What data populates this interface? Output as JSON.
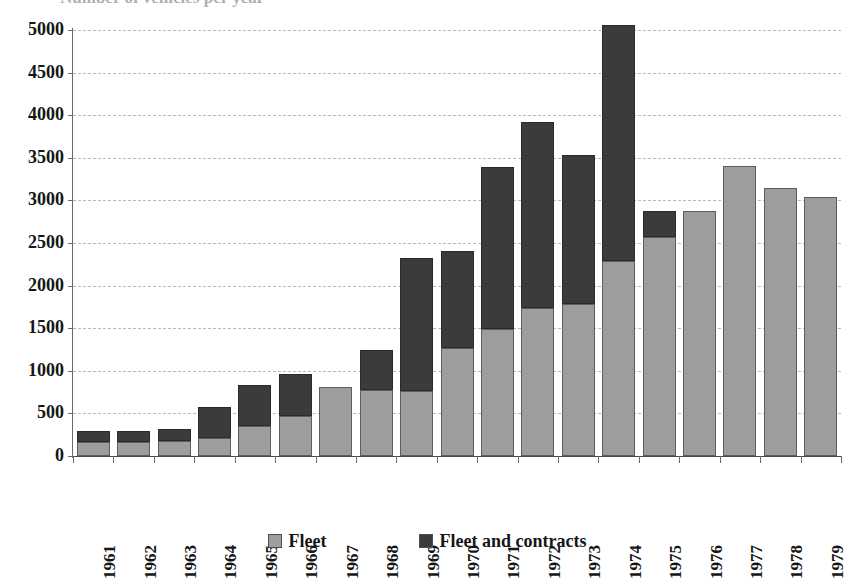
{
  "title_partial": "Number of vehicles per year",
  "legend": {
    "position": "bottom",
    "items": [
      {
        "label": "Fleet",
        "color": "#9d9d9d",
        "icon": "square-swatch-icon"
      },
      {
        "label": "Fleet and contracts",
        "color": "#3b3b3b",
        "icon": "square-swatch-icon"
      }
    ]
  },
  "chart_data": {
    "type": "bar",
    "stacked": true,
    "title": "",
    "xlabel": "",
    "ylabel": "",
    "ylim": [
      0,
      5000
    ],
    "ytick_step": 500,
    "ytick_labels": [
      "0",
      "500",
      "1000",
      "1500",
      "2000",
      "2500",
      "3000",
      "3500",
      "4000",
      "4500",
      "5000"
    ],
    "grid": true,
    "grid_axis": "y",
    "categories": [
      "1961",
      "1962",
      "1963",
      "1964",
      "1965",
      "1966",
      "1967",
      "1968",
      "1969",
      "1970",
      "1971",
      "1972",
      "1973",
      "1974",
      "1975",
      "1976",
      "1977",
      "1978",
      "1979"
    ],
    "series": [
      {
        "name": "Fleet",
        "color": "#9d9d9d",
        "values": [
          165,
          165,
          175,
          210,
          350,
          470,
          805,
          770,
          760,
          1270,
          1490,
          1740,
          1790,
          2290,
          2570,
          2870,
          3400,
          3140,
          3040
        ]
      },
      {
        "name": "Fleet and contracts",
        "color": "#3b3b3b",
        "note": "dark segment drawn above the Fleet segment; value is the stacked total",
        "values": [
          290,
          295,
          320,
          575,
          830,
          960,
          805,
          1245,
          2320,
          2410,
          3390,
          3920,
          3530,
          5060,
          2880,
          2870,
          3400,
          3140,
          3040
        ]
      }
    ]
  }
}
